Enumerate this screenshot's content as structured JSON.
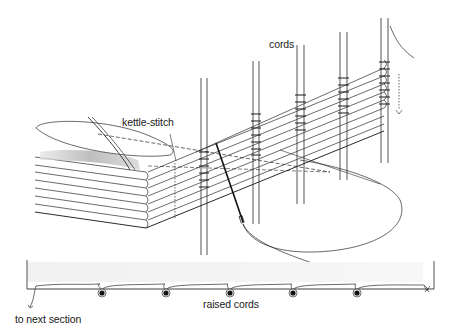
{
  "diagram": {
    "labels": {
      "cords": "cords",
      "kettle_stitch": "kettle-stitch",
      "raised_cords": "raised cords",
      "to_next_section": "to next section"
    },
    "colors": {
      "line": "#2a2a2a",
      "thread": "#444444",
      "shadow": "#b8b8b8",
      "cord_fill": "#111111",
      "background": "#ffffff"
    },
    "cord_count": 5,
    "section_count": 7
  }
}
